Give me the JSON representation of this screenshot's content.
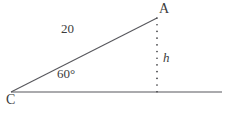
{
  "figure": {
    "kind": "geometry-triangle-diagram",
    "background_color": "#ffffff",
    "stroke_color": "#57575c",
    "text_color": "#3c3c3c",
    "labels": {
      "vertex_a": "A",
      "vertex_c": "C",
      "side_length": "20",
      "angle": "60°",
      "height": "h"
    },
    "geometry": {
      "vertex_c": [
        11,
        92
      ],
      "vertex_a": [
        157,
        18
      ],
      "foot": [
        157,
        92
      ],
      "baseline_start": [
        11,
        92
      ],
      "baseline_end": [
        222,
        92
      ],
      "hypotenuse_style": "solid",
      "baseline_style": "solid",
      "height_style": "dotted"
    }
  }
}
